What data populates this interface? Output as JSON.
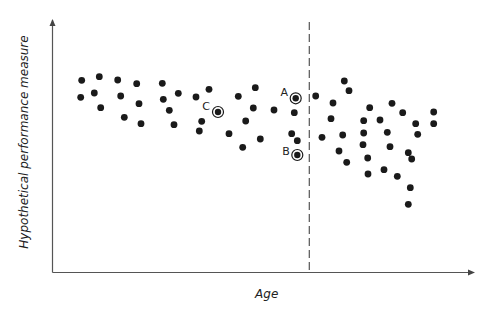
{
  "chart_data": {
    "type": "scatter",
    "title": "",
    "xlabel": "Age",
    "ylabel": "Hypothetical performance measure",
    "grid": false,
    "legend": null,
    "axis_ticks": false,
    "note": "Coordinates are in screen pixels (origin top-left of image); no numeric tick labels are shown. Higher on screen = higher performance.",
    "plot_area": {
      "x_axis_y": 272.5,
      "y_axis_x": 52.5,
      "x_axis_end": 476,
      "y_axis_top": 18
    },
    "divider": {
      "style": "dashed",
      "x": 309.3,
      "y_top": 22,
      "y_bottom": 272.5
    },
    "points": [
      [
        81.7,
        80.3
      ],
      [
        99.3,
        76.7
      ],
      [
        117.7,
        80
      ],
      [
        136.7,
        83.7
      ],
      [
        80.7,
        97.3
      ],
      [
        94.3,
        93
      ],
      [
        120.7,
        96
      ],
      [
        100.7,
        107.7
      ],
      [
        139,
        103.7
      ],
      [
        124.3,
        117.3
      ],
      [
        141,
        123.7
      ],
      [
        162.3,
        83.3
      ],
      [
        178.3,
        93.3
      ],
      [
        163.3,
        99.3
      ],
      [
        196,
        97
      ],
      [
        209,
        89.3
      ],
      [
        238.3,
        96.3
      ],
      [
        169.3,
        110.3
      ],
      [
        201.7,
        121.3
      ],
      [
        174,
        124.7
      ],
      [
        199.3,
        131
      ],
      [
        245.7,
        121
      ],
      [
        229,
        133.7
      ],
      [
        242.7,
        147.3
      ],
      [
        255.3,
        87.7
      ],
      [
        253.3,
        108
      ],
      [
        274,
        110
      ],
      [
        294.3,
        112.7
      ],
      [
        291.7,
        133.7
      ],
      [
        297.3,
        140.7
      ],
      [
        260.3,
        139
      ],
      [
        315.7,
        96
      ],
      [
        322,
        137.3
      ],
      [
        344.3,
        81
      ],
      [
        349,
        90.7
      ],
      [
        333,
        103
      ],
      [
        369.7,
        107.7
      ],
      [
        392,
        103.3
      ],
      [
        331,
        118.7
      ],
      [
        363.7,
        120.7
      ],
      [
        380,
        120
      ],
      [
        342.7,
        135
      ],
      [
        363.7,
        133
      ],
      [
        387.3,
        132.3
      ],
      [
        363,
        144.7
      ],
      [
        390,
        146.7
      ],
      [
        339,
        151
      ],
      [
        367.7,
        158
      ],
      [
        346.7,
        162.3
      ],
      [
        368,
        174
      ],
      [
        384,
        169.7
      ],
      [
        397.3,
        176.3
      ],
      [
        402.7,
        112.7
      ],
      [
        433.7,
        112
      ],
      [
        433.7,
        123.7
      ],
      [
        415.7,
        123.7
      ],
      [
        417.7,
        134.3
      ],
      [
        408.3,
        152.7
      ],
      [
        411.7,
        159
      ],
      [
        410.3,
        187.7
      ],
      [
        408.3,
        204.3
      ]
    ],
    "highlighted_points": [
      {
        "label": "A",
        "x": 295.7,
        "y": 98.3,
        "label_x": 284.3,
        "label_y": 96
      },
      {
        "label": "B",
        "x": 297.3,
        "y": 155,
        "label_x": 286,
        "label_y": 155
      },
      {
        "label": "C",
        "x": 218,
        "y": 112,
        "label_x": 206,
        "label_y": 110
      }
    ],
    "colors": {
      "axis": "#555555",
      "point": "#1a1a1a",
      "divider": "#555555"
    }
  }
}
